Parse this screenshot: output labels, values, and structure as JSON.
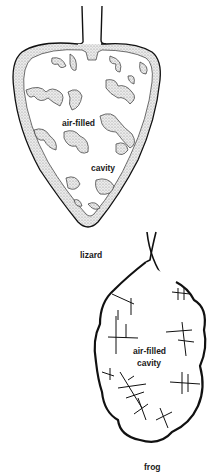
{
  "diagram": {
    "lizard": {
      "caption": "lizard",
      "cavity_label_line1": "air-filled",
      "cavity_label_line2": "cavity"
    },
    "frog": {
      "caption": "frog",
      "cavity_label_line1": "air-filled",
      "cavity_label_line2": "cavity"
    },
    "colors": {
      "ink": "#111111",
      "stipple": "#d9d9d9",
      "background": "#ffffff"
    }
  }
}
